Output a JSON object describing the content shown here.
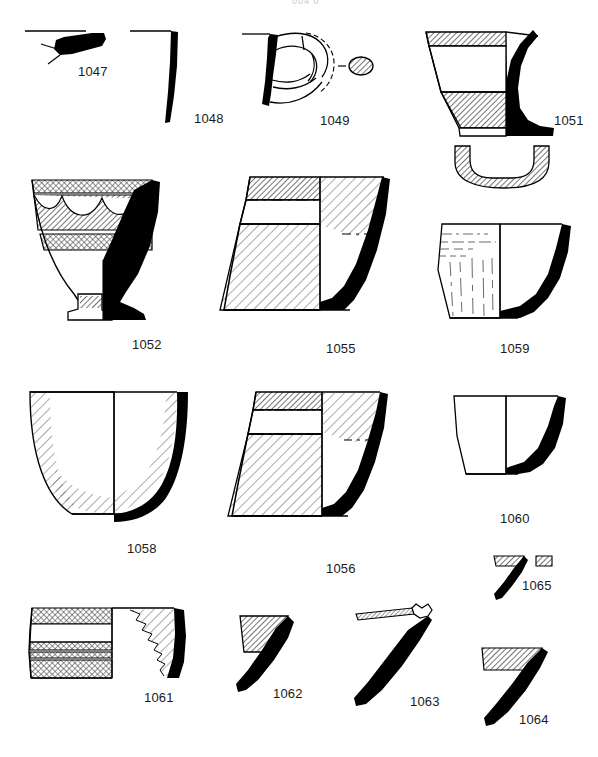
{
  "plate": {
    "kind": "archaeological-pottery-drawing-plate",
    "background_color": "#ffffff",
    "ink_color": "#000000",
    "label_color": "#1a1a1a",
    "hatch_color": "#3a3a3a",
    "width": 598,
    "height": 757,
    "top_cut_text": "004  0"
  },
  "figures": [
    {
      "id": "1047",
      "label": "1047",
      "type": "rim-sherd",
      "description": "small solid-black thickened rim fragment with reconstruction tick lines, rim line extending left",
      "label_x": 78,
      "label_y": 64
    },
    {
      "id": "1048",
      "label": "1048",
      "type": "body-profile",
      "description": "tall narrow solid-black vertical wall profile with short horizontal rim line at top",
      "label_x": 194,
      "label_y": 111
    },
    {
      "id": "1049",
      "label": "1049",
      "type": "handle",
      "description": "loop handle attached to solid-black wall, with hatched oval section drawing at right",
      "label_x": 320,
      "label_y": 113
    },
    {
      "id": "1051",
      "label": "1051",
      "type": "bowl-with-base-ring",
      "description": "open bowl, left half hatched in two bands, right half solid black, separate U-shaped base ring profile below",
      "label_x": 554,
      "label_y": 113
    },
    {
      "id": "1052",
      "label": "1052",
      "type": "footed-goblet",
      "description": "footed cup with painted festoon/garland decoration band, hatched bands at rim and mid-body, pedestal foot",
      "label_x": 132,
      "label_y": 337
    },
    {
      "id": "1055",
      "label": "1055",
      "type": "conical-cup",
      "description": "tall flaring conical cup, left half hatched with horizontal dashed bands, right half partly hatched with solid black wall",
      "label_x": 326,
      "label_y": 341
    },
    {
      "id": "1059",
      "label": "1059",
      "type": "conical-cup",
      "description": "conical cup with faint streaky vertical and horizontal painted lines on left half, solid black wall on right",
      "label_x": 500,
      "label_y": 341
    },
    {
      "id": "1058",
      "label": "1058",
      "type": "rounded-bowl",
      "description": "large rounded bowl, hatching concentrated along left edge and lower curve, solid black right wall",
      "label_x": 127,
      "label_y": 541
    },
    {
      "id": "1056",
      "label": "1056",
      "type": "conical-cup",
      "description": "flaring conical cup with hatched rim band and hatched lower body, solid black right wall and base",
      "label_x": 326,
      "label_y": 561
    },
    {
      "id": "1060",
      "label": "1060",
      "type": "plain-cup",
      "description": "small plain undecorated cup, solid black right wall",
      "label_x": 500,
      "label_y": 511
    },
    {
      "id": "1061",
      "label": "1061",
      "type": "banded-body-sherd",
      "description": "cylindrical body sherd with horizontal painted bands, ragged break edge, solid black wall at right",
      "label_x": 144,
      "label_y": 690
    },
    {
      "id": "1062",
      "label": "1062",
      "type": "rim-sherd",
      "description": "small rim sherd with hatched interior triangle and thick solid-black wall angled down-left",
      "label_x": 273,
      "label_y": 686
    },
    {
      "id": "1063",
      "label": "1063",
      "type": "rim-sherd",
      "description": "rim sherd with thin horizontal hatched strip at top and long solid-black diagonal wall",
      "label_x": 410,
      "label_y": 694
    },
    {
      "id": "1064",
      "label": "1064",
      "type": "rim-sherd",
      "description": "rim sherd with hatched horizontal band at top and solid-black wall angled down-left",
      "label_x": 519,
      "label_y": 712
    },
    {
      "id": "1065",
      "label": "1065",
      "type": "rim-sherd",
      "description": "small rim sherd with short hatched band, solid-black wall and detached hatched block to the right",
      "label_x": 522,
      "label_y": 578
    }
  ]
}
